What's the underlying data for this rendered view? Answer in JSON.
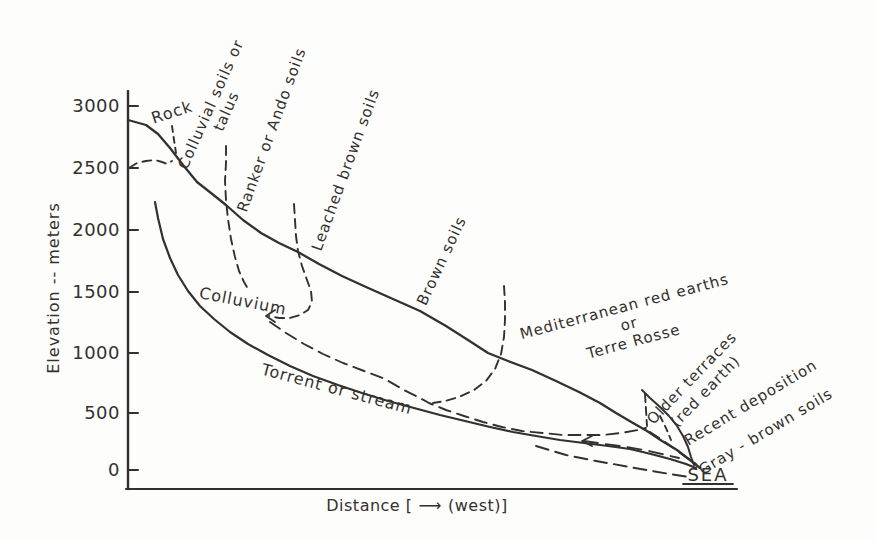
{
  "colors": {
    "ink": "#33312e",
    "paper": "#fdfdfb"
  },
  "y_axis": {
    "label": "Elevation -- meters",
    "ticks": [
      "3000",
      "2500",
      "2000",
      "1500",
      "1000",
      "500",
      "0"
    ]
  },
  "x_axis": {
    "prefix": "Distance [",
    "arrow": "⟶",
    "suffix": "(west)]"
  },
  "zones": {
    "rock": "Rock",
    "colluvial_line1": "Colluvial soils or",
    "colluvial_line2": "talus",
    "ranker": "Ranker or Ando soils",
    "leached": "Leached brown soils",
    "brown": "Brown soils",
    "med_line1": "Mediterranean red earths",
    "med_line2": "or",
    "med_line3": "Terre Rosse",
    "older_line1": "Older terraces",
    "older_line2": "(red earth)",
    "recent": "Recent deposition",
    "gray_brown": "Gray - brown soils"
  },
  "features": {
    "colluvium": "Colluvium",
    "torrent": "Torrent or stream",
    "sea": "SEA"
  }
}
